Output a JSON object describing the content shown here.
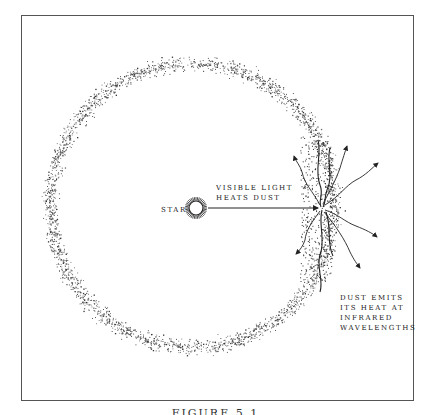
{
  "figure": {
    "labels": {
      "star": "STAR",
      "light_line1": "VISIBLE LIGHT",
      "light_line2": "HEATS DUST",
      "emit_line1": "DUST EMITS",
      "emit_line2": "ITS HEAT AT",
      "emit_line3": "INFRARED",
      "emit_line4": "WAVELENGTHS"
    },
    "caption": "FIGURE 5.1",
    "colors": {
      "ink": "#222222",
      "frame": "#555555",
      "background": "#ffffff"
    },
    "elements": {
      "star_icon": "sun-icon",
      "dust_ring": "dust-ring",
      "light_arrow": "arrow-right-icon",
      "infrared_arrows": "wavy-arrow-icon"
    }
  }
}
